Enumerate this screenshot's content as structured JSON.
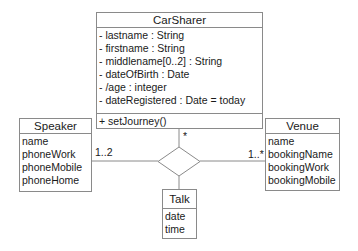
{
  "diagram": {
    "type": "UML class diagram",
    "classes": {
      "carsharer": {
        "name": "CarSharer",
        "attributes": [
          "- lastname : String",
          "- firstname : String",
          "- middlename[0..2] : String",
          "- dateOfBirth : Date",
          "- /age : integer",
          "- dateRegistered : Date = today"
        ],
        "operations": [
          "+ setJourney()"
        ]
      },
      "speaker": {
        "name": "Speaker",
        "attributes": [
          "name",
          "phoneWork",
          "phoneMobile",
          "phoneHome"
        ]
      },
      "venue": {
        "name": "Venue",
        "attributes": [
          "name",
          "bookingName",
          "bookingWork",
          "bookingMobile"
        ]
      },
      "talk": {
        "name": "Talk",
        "attributes": [
          "date",
          "time"
        ]
      }
    },
    "association": {
      "kind": "n-ary (diamond)",
      "multiplicities": {
        "carsharer": "*",
        "speaker": "1..2",
        "venue": "1..*"
      }
    },
    "colors": {
      "line": "#8a8a8a",
      "text": "#1a1a1a",
      "background": "#ffffff"
    }
  }
}
